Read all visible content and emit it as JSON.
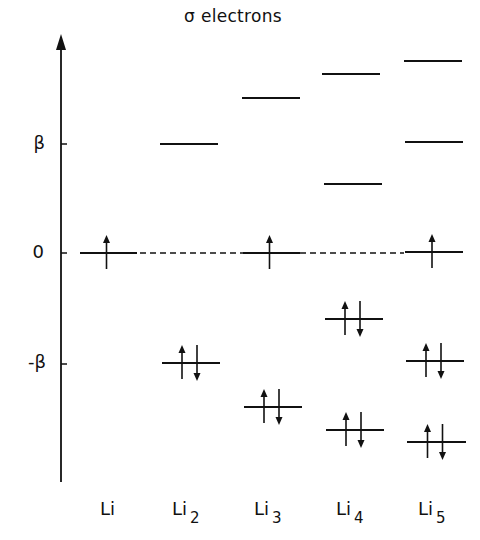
{
  "title": "σ electrons",
  "axis": {
    "x": 61,
    "top": 34,
    "bottom": 482,
    "ticks": [
      {
        "label": "β",
        "y": 144
      },
      {
        "label": "0",
        "y": 253
      },
      {
        "label": "-β",
        "y": 364
      }
    ]
  },
  "reference_line": {
    "y": 253,
    "style": "dashed",
    "x_start": 140,
    "x_end": 404
  },
  "molecules": [
    {
      "name": "Li",
      "subscript": "",
      "label_x": 98,
      "levels": [
        {
          "y": 253,
          "x1": 80,
          "x2": 137,
          "electrons": "up"
        }
      ]
    },
    {
      "name": "Li",
      "subscript": "2",
      "label_x": 172,
      "levels": [
        {
          "y": 144,
          "x1": 160,
          "x2": 218,
          "electrons": "none"
        },
        {
          "y": 363,
          "x1": 162,
          "x2": 220,
          "electrons": "pair"
        }
      ]
    },
    {
      "name": "Li",
      "subscript": "3",
      "label_x": 254,
      "levels": [
        {
          "y": 98,
          "x1": 242,
          "x2": 300,
          "electrons": "none"
        },
        {
          "y": 253,
          "x1": 243,
          "x2": 300,
          "electrons": "up"
        },
        {
          "y": 407,
          "x1": 244,
          "x2": 302,
          "electrons": "pair"
        }
      ]
    },
    {
      "name": "Li",
      "subscript": "4",
      "label_x": 336,
      "levels": [
        {
          "y": 74,
          "x1": 322,
          "x2": 380,
          "electrons": "none"
        },
        {
          "y": 184,
          "x1": 324,
          "x2": 382,
          "electrons": "none"
        },
        {
          "y": 319,
          "x1": 325,
          "x2": 383,
          "electrons": "pair"
        },
        {
          "y": 430,
          "x1": 326,
          "x2": 384,
          "electrons": "pair"
        }
      ]
    },
    {
      "name": "Li",
      "subscript": "5",
      "label_x": 418,
      "levels": [
        {
          "y": 61,
          "x1": 404,
          "x2": 462,
          "electrons": "none"
        },
        {
          "y": 142,
          "x1": 405,
          "x2": 463,
          "electrons": "none"
        },
        {
          "y": 252,
          "x1": 405,
          "x2": 463,
          "electrons": "up"
        },
        {
          "y": 361,
          "x1": 406,
          "x2": 464,
          "electrons": "pair"
        },
        {
          "y": 442,
          "x1": 407,
          "x2": 466,
          "electrons": "pair"
        }
      ]
    }
  ],
  "colors": {
    "ink": "#111111",
    "background": "#ffffff"
  }
}
